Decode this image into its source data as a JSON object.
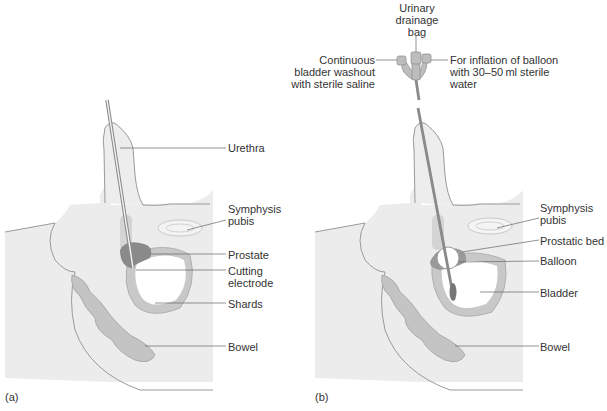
{
  "figure": {
    "panel_a": {
      "caption": "(a)",
      "labels": {
        "urethra": "Urethra",
        "symphysis_1": "Symphysis",
        "symphysis_2": "pubis",
        "prostate": "Prostate",
        "cutting_1": "Cutting",
        "cutting_2": "electrode",
        "shards": "Shards",
        "bowel": "Bowel"
      }
    },
    "panel_b": {
      "caption": "(b)",
      "labels": {
        "drainage_1": "Urinary",
        "drainage_2": "drainage",
        "drainage_3": "bag",
        "washout_1": "Continuous",
        "washout_2": "bladder washout",
        "washout_3": "with sterile saline",
        "inflation_1": "For inflation of balloon",
        "inflation_2": "with 30–50 ml sterile",
        "inflation_3": "water",
        "symphysis_1": "Symphysis",
        "symphysis_2": "pubis",
        "prostatic_bed": "Prostatic bed",
        "balloon": "Balloon",
        "bladder": "Bladder",
        "bowel": "Bowel"
      }
    },
    "colors": {
      "body_fill": "#ececec",
      "outline": "#9a9a9a",
      "bladder_wall": "#c8c8c8",
      "prostate": "#8a8a8a",
      "bowel": "#c4c4c4",
      "leader": "#666666"
    }
  }
}
